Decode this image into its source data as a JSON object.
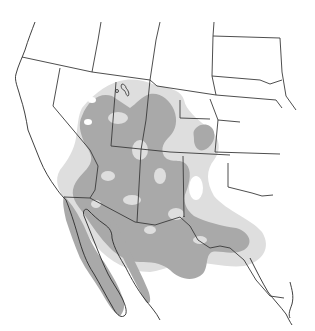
{
  "map": {
    "type": "range-distribution",
    "region": "Southwestern United States and Northern Mexico",
    "legend": [],
    "colors": {
      "background": "#ffffff",
      "core_range": "#a9a9a9",
      "peripheral_range": "#dedede",
      "borders": "#3a3a3a"
    }
  }
}
